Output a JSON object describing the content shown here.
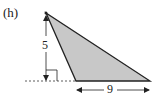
{
  "figure": {
    "part_label": "(h)",
    "height_label": "5",
    "base_label": "9",
    "shape": "obtuse-triangle",
    "fill_color": "#c8c8c8",
    "stroke_color": "#222222"
  }
}
